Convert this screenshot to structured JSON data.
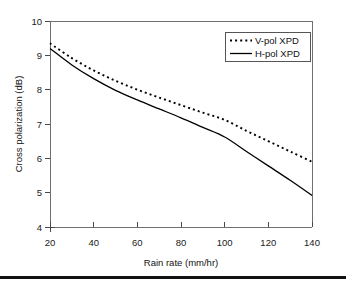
{
  "chart_data": {
    "type": "line",
    "title": "",
    "xlabel": "Rain rate (mm/hr)",
    "ylabel": "Cross polarization (dB)",
    "xlim": [
      20,
      140
    ],
    "ylim": [
      4,
      10
    ],
    "xticks": [
      20,
      40,
      60,
      80,
      100,
      120,
      140
    ],
    "yticks": [
      4,
      5,
      6,
      7,
      8,
      9,
      10
    ],
    "grid": false,
    "legend_position": "top-right",
    "x": [
      20,
      30,
      40,
      50,
      60,
      70,
      80,
      90,
      100,
      110,
      120,
      130,
      140
    ],
    "series": [
      {
        "name": "V-pol XPD",
        "style": "dotted",
        "color": "#000000",
        "values": [
          9.35,
          8.92,
          8.56,
          8.26,
          8.0,
          7.77,
          7.55,
          7.33,
          7.12,
          6.8,
          6.5,
          6.2,
          5.9
        ]
      },
      {
        "name": "H-pol XPD",
        "style": "solid",
        "color": "#000000",
        "values": [
          9.2,
          8.72,
          8.32,
          7.98,
          7.7,
          7.44,
          7.18,
          6.9,
          6.62,
          6.2,
          5.78,
          5.36,
          4.92
        ]
      }
    ]
  },
  "axis": {
    "x_label": "Rain rate (mm/hr)",
    "y_label": "Cross polarization (dB)",
    "x_tick_labels": [
      "20",
      "40",
      "60",
      "80",
      "100",
      "120",
      "140"
    ],
    "y_tick_labels": [
      "4",
      "5",
      "6",
      "7",
      "8",
      "9",
      "10"
    ]
  },
  "legend": {
    "entries": [
      {
        "label": "V-pol XPD",
        "style": "dotted"
      },
      {
        "label": "H-pol XPD",
        "style": "solid"
      }
    ]
  },
  "colors": {
    "series": "#000000",
    "axis": "#6f6f6f",
    "text": "#111111",
    "background": "#ffffff",
    "rule": "#111111"
  }
}
